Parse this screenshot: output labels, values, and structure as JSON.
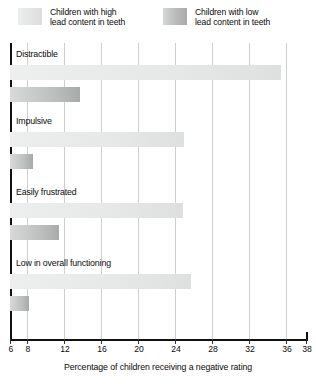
{
  "legend": {
    "items": [
      {
        "key": "high",
        "label": "Children with high\nlead content in teeth",
        "swatch": "light-gray-gradient",
        "color": "#e6e7e7"
      },
      {
        "key": "low",
        "label": "Children with low\nlead content in teeth",
        "swatch": "dark-gray-gradient",
        "color": "#bcbdbd"
      }
    ]
  },
  "axis": {
    "title": "Percentage of children receiving a negative rating",
    "ticks": [
      "6",
      "8",
      "12",
      "16",
      "20",
      "24",
      "28",
      "32",
      "36",
      "38"
    ]
  },
  "categories": [
    {
      "label": "Distractible"
    },
    {
      "label": "Impulsive"
    },
    {
      "label": "Easily frustrated"
    },
    {
      "label": "Low in overall functioning"
    }
  ],
  "chart_data": {
    "type": "bar",
    "orientation": "horizontal",
    "title": "",
    "xlabel": "Percentage of children receiving a negative rating",
    "ylabel": "",
    "xlim": [
      6,
      38
    ],
    "xticks": [
      6,
      8,
      12,
      16,
      20,
      24,
      28,
      32,
      36,
      38
    ],
    "grid": true,
    "legend_position": "top",
    "categories": [
      "Distractible",
      "Impulsive",
      "Easily frustrated",
      "Low in overall functioning"
    ],
    "series": [
      {
        "name": "Children with high lead content in teeth",
        "values": [
          35.3,
          24.8,
          24.7,
          25.6
        ]
      },
      {
        "name": "Children with low lead content in teeth",
        "values": [
          13.6,
          8.5,
          11.3,
          8.1
        ]
      }
    ]
  }
}
